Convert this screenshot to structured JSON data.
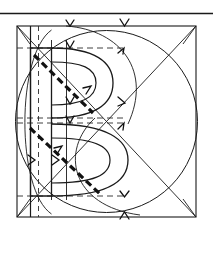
{
  "figure": {
    "title": "Geometric construction of the letter B",
    "caption": "",
    "background_color": "#ffffff",
    "ink_color": "#1a1a1a",
    "light_ink_color": "#2b2b2b",
    "canvas": {
      "width": 213,
      "height": 271
    }
  },
  "chart_data": {
    "type": "diagram",
    "title": "Geometric construction of the letter B",
    "page_rule": {
      "label": "top-rule",
      "x1": 0,
      "y1": 13,
      "x2": 213,
      "y2": 13
    },
    "square": {
      "label": "construction-square",
      "left": 17,
      "top": 26,
      "right": 196,
      "bottom": 217,
      "width": 179,
      "height": 191
    },
    "circle": {
      "label": "inscribed-circle",
      "cx": 105,
      "cy": 121,
      "r": 91
    },
    "diagonals": [
      {
        "label": "diagonal-tl-br",
        "x1": 17,
        "y1": 26,
        "x2": 196,
        "y2": 217
      },
      {
        "label": "diagonal-bl-tr",
        "x1": 17,
        "y1": 217,
        "x2": 196,
        "y2": 26
      }
    ],
    "vertical_guides": [
      {
        "label": "stem-left-solid",
        "x": 30,
        "dashed": false
      },
      {
        "label": "stem-axis-dashed",
        "x": 38,
        "dashed": true
      },
      {
        "label": "stem-right-solid",
        "x": 51,
        "dashed": false
      },
      {
        "label": "counter-center-solid",
        "x": 66,
        "dashed": false
      }
    ],
    "horizontal_guides": [
      {
        "label": "cap-line-dashed",
        "y": 48,
        "dashed": true
      },
      {
        "label": "upper-bowl-base-dashed",
        "y": 118,
        "dashed": true
      },
      {
        "label": "lower-bowl-top-dashed",
        "y": 123,
        "dashed": true
      },
      {
        "label": "baseline-dashed",
        "y": 196,
        "dashed": true
      }
    ],
    "letter": {
      "glyph": "B",
      "stem": {
        "x_left": 30,
        "x_right": 51,
        "y_top": 48,
        "y_bottom": 196
      },
      "upper_bowl": {
        "cx": 66,
        "cy": 83,
        "rx": 47,
        "ry": 36
      },
      "upper_counter": {
        "cx": 66,
        "cy": 83,
        "rx": 30,
        "ry": 23
      },
      "lower_bowl": {
        "cx": 66,
        "cy": 159,
        "rx": 60,
        "ry": 38
      },
      "lower_counter": {
        "cx": 66,
        "cy": 159,
        "rx": 42,
        "ry": 25
      }
    },
    "stress_axes": [
      {
        "label": "upper-stress-axis",
        "x1": 34,
        "y1": 55,
        "x2": 93,
        "y2": 113,
        "style": "heavy-dashed"
      },
      {
        "label": "lower-stress-axis",
        "x1": 30,
        "y1": 128,
        "x2": 100,
        "y2": 194,
        "style": "heavy-dashed"
      }
    ],
    "arrow_ticks": [
      {
        "label": "tick-top-left",
        "x": 70,
        "y": 24,
        "dir": "down"
      },
      {
        "label": "tick-top-right",
        "x": 124,
        "y": 24,
        "dir": "down"
      },
      {
        "label": "tick-cap-right",
        "x": 123,
        "y": 50,
        "dir": "up-left"
      },
      {
        "label": "tick-upper-inner",
        "x": 70,
        "y": 47,
        "dir": "down"
      },
      {
        "label": "tick-upper-stem",
        "x": 70,
        "y": 103,
        "dir": "down"
      },
      {
        "label": "tick-mid-right",
        "x": 124,
        "y": 102,
        "dir": "down-right"
      },
      {
        "label": "tick-mid-right-2",
        "x": 124,
        "y": 124,
        "dir": "up-left"
      },
      {
        "label": "tick-lower-inner",
        "x": 70,
        "y": 122,
        "dir": "down"
      },
      {
        "label": "tick-left-mid",
        "x": 33,
        "y": 160,
        "dir": "right"
      },
      {
        "label": "tick-counter-mid",
        "x": 57,
        "y": 160,
        "dir": "right"
      },
      {
        "label": "tick-baseline",
        "x": 124,
        "y": 197,
        "dir": "down"
      },
      {
        "label": "tick-bottom",
        "x": 124,
        "y": 214,
        "dir": "up"
      }
    ],
    "grid": false,
    "legend": null,
    "annotations": []
  }
}
